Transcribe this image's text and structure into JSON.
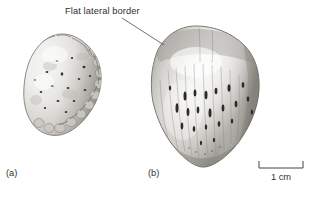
{
  "figure": {
    "background_color": "#ffffff",
    "ink_color": "#2f2f2f",
    "leader_line_color": "#555555"
  },
  "annotations": [
    {
      "id": "flat-lateral-border",
      "text": "Flat lateral border",
      "leader_from_x": 122,
      "leader_from_y": 18,
      "leader_to_x": 164,
      "leader_to_y": 45
    }
  ],
  "panels": [
    {
      "id": "a",
      "label": "(a)",
      "description": "small rounded nodular bone specimen with pitted surface",
      "bbox": {
        "x": 25,
        "y": 34,
        "width": 76,
        "height": 102
      }
    },
    {
      "id": "b",
      "label": "(b)",
      "description": "larger shield shaped bone specimen with vertical striations and elongate foramina",
      "bbox": {
        "x": 152,
        "y": 26,
        "width": 108,
        "height": 141
      }
    }
  ],
  "scale_bar": {
    "label": "1 cm",
    "length_px": 46,
    "bracket_tick_height_px": 7
  }
}
